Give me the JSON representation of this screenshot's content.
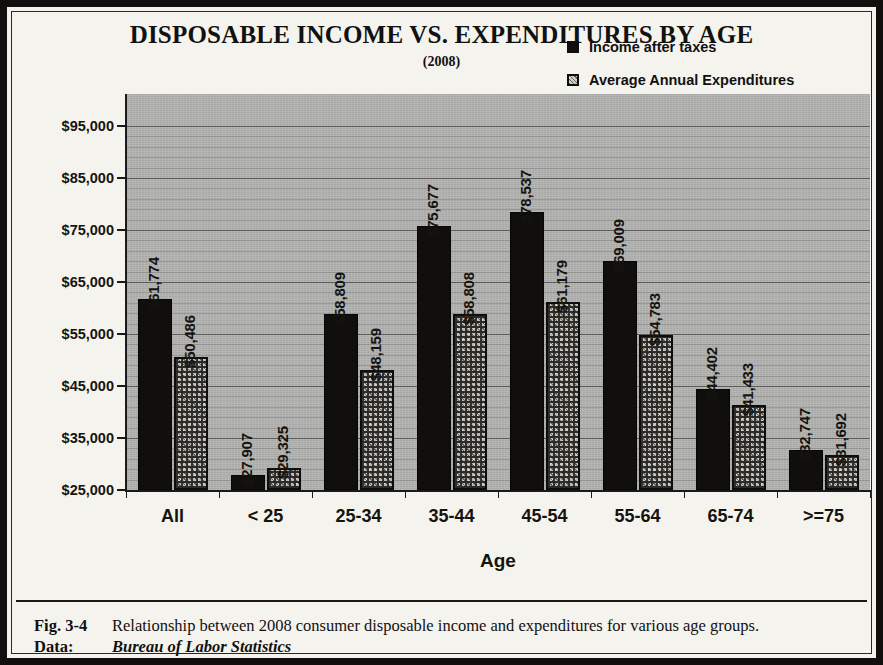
{
  "figure": {
    "title": "DISPOSABLE INCOME VS. EXPENDITURES BY AGE",
    "subtitle": "(2008)",
    "caption_label": "Fig. 3-4",
    "caption_text": "Relationship between 2008 consumer disposable income and expenditures for various age groups.",
    "data_label": "Data:",
    "data_source": "Bureau of Labor Statistics"
  },
  "legend": {
    "position": "top-right",
    "items": [
      {
        "label": "Income after taxes",
        "swatch": "solid-black-square",
        "color": "#100f0d"
      },
      {
        "label": "Average Annual Expenditures",
        "swatch": "hatched-square",
        "color": "#b9b8b3"
      }
    ]
  },
  "axis": {
    "y_ticks": [
      "$25,000",
      "$35,000",
      "$45,000",
      "$55,000",
      "$65,000",
      "$75,000",
      "$85,000",
      "$95,000"
    ],
    "x_title": "Age"
  },
  "chart_data": {
    "type": "bar",
    "title": "DISPOSABLE INCOME VS. EXPENDITURES BY AGE",
    "subtitle": "(2008)",
    "xlabel": "Age",
    "ylabel": "",
    "ylim": [
      25000,
      95000
    ],
    "ytick_step": 10000,
    "ytick_labels": [
      "$25,000",
      "$35,000",
      "$45,000",
      "$55,000",
      "$65,000",
      "$75,000",
      "$85,000",
      "$95,000"
    ],
    "grid": true,
    "legend_position": "top-right",
    "categories": [
      "All",
      "< 25",
      "25-34",
      "35-44",
      "45-54",
      "55-64",
      "65-74",
      ">=75"
    ],
    "series": [
      {
        "name": "Income after taxes",
        "color": "#100f0d",
        "values": [
          61774,
          27907,
          58809,
          75677,
          78537,
          69009,
          44402,
          32747
        ],
        "labels": [
          "$61,774",
          "$27,907",
          "$58,809",
          "$75,677",
          "$78,537",
          "$69,009",
          "$44,402",
          "$32,747"
        ]
      },
      {
        "name": "Average Annual Expenditures",
        "color": "#b9b8b3",
        "values": [
          50486,
          29325,
          48159,
          58808,
          61179,
          54783,
          41433,
          31692
        ],
        "labels": [
          "$50,486",
          "$29,325",
          "$48,159",
          "$58,808",
          "$61,179",
          "$54,783",
          "$41,433",
          "$31,692"
        ]
      }
    ]
  }
}
